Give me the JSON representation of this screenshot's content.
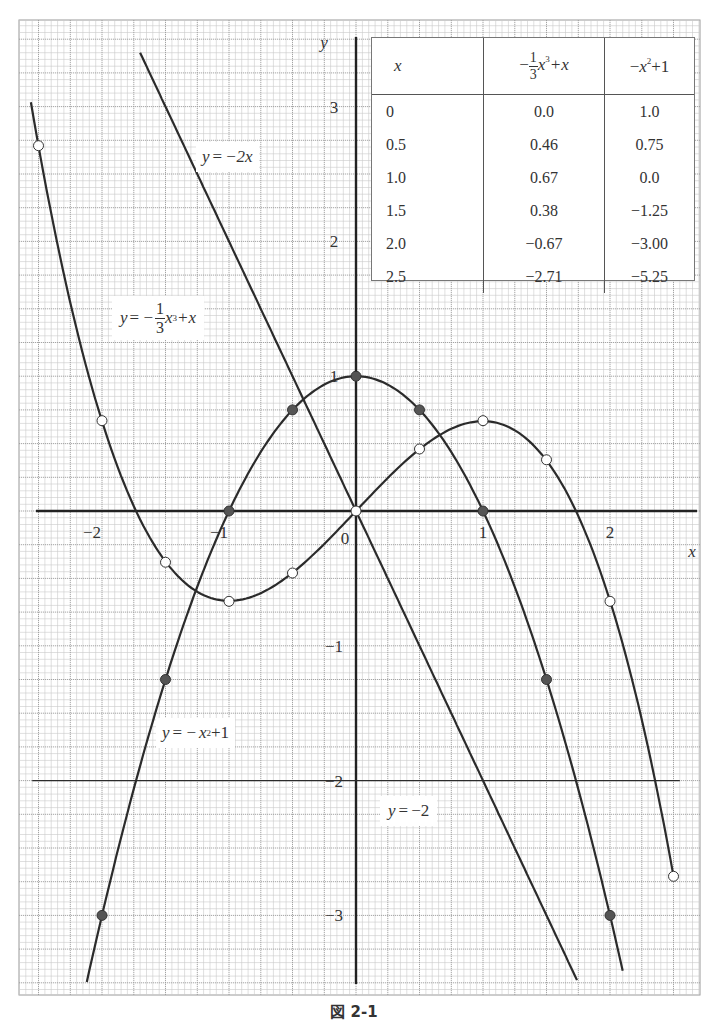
{
  "caption": "図 2-1",
  "chart_data": {
    "type": "line",
    "title": "図 2-1",
    "xlabel": "x",
    "ylabel": "y",
    "xlim": [
      -2.55,
      2.55
    ],
    "ylim": [
      -3.55,
      3.55
    ],
    "grid": true,
    "x_ticks": [
      -2,
      -1,
      0,
      1,
      2
    ],
    "x_tick_labels": [
      "−2",
      "−1",
      "0",
      "1",
      "2"
    ],
    "y_ticks": [
      -3,
      -2,
      -1,
      1,
      2,
      3
    ],
    "y_tick_labels": [
      "−3",
      "−2",
      "−1",
      "1",
      "2",
      "3"
    ],
    "series": [
      {
        "name": "y=−1/3x³+x",
        "expr": "cubic",
        "x_range": [
          -2.56,
          2.5
        ],
        "marker": "open-circle",
        "points": [
          {
            "x": -2.5,
            "y": 2.71
          },
          {
            "x": -2.0,
            "y": 0.67
          },
          {
            "x": -1.5,
            "y": -0.38
          },
          {
            "x": -1.0,
            "y": -0.67
          },
          {
            "x": -0.5,
            "y": -0.46
          },
          {
            "x": 0.0,
            "y": 0.0
          },
          {
            "x": 0.5,
            "y": 0.46
          },
          {
            "x": 1.0,
            "y": 0.67
          },
          {
            "x": 1.5,
            "y": 0.38
          },
          {
            "x": 2.0,
            "y": -0.67
          },
          {
            "x": 2.5,
            "y": -2.71
          }
        ]
      },
      {
        "name": "y=−x²+1",
        "expr": "parabola",
        "x_range": [
          -2.12,
          2.1
        ],
        "marker": "filled-circle",
        "points": [
          {
            "x": -2.0,
            "y": -3.0
          },
          {
            "x": -1.5,
            "y": -1.25
          },
          {
            "x": -1.0,
            "y": 0.0
          },
          {
            "x": -0.5,
            "y": 0.75
          },
          {
            "x": 0.0,
            "y": 1.0
          },
          {
            "x": 0.5,
            "y": 0.75
          },
          {
            "x": 1.0,
            "y": 0.0
          },
          {
            "x": 1.5,
            "y": -1.25
          },
          {
            "x": 2.0,
            "y": -3.0
          }
        ]
      },
      {
        "name": "y=−2x",
        "expr": "linear",
        "x_range": [
          -1.7,
          1.74
        ],
        "marker": "none",
        "points": [
          {
            "x": -1.7,
            "y": 3.4
          },
          {
            "x": 1.74,
            "y": -3.48
          }
        ]
      },
      {
        "name": "y=−2",
        "expr": "constant",
        "x_range": [
          -2.55,
          2.55
        ],
        "marker": "none",
        "points": [
          {
            "x": -2.55,
            "y": -2
          },
          {
            "x": 2.55,
            "y": -2
          }
        ]
      }
    ],
    "annotations": [
      {
        "text": "y=−2x",
        "x": -1.0,
        "y": 2.8
      },
      {
        "text": "y=−1/3x³+x",
        "x": -1.85,
        "y": 1.45
      },
      {
        "text": "y=−x²+1",
        "x": -1.4,
        "y": -1.6
      },
      {
        "text": "y=−2",
        "x": 0.45,
        "y": -2.3
      }
    ],
    "value_table": {
      "headers": [
        "x",
        "−1/3x³+x",
        "−x²+1"
      ],
      "rows": [
        [
          "0",
          "0.0",
          "1.0"
        ],
        [
          "0.5",
          "0.46",
          "0.75"
        ],
        [
          "1.0",
          "0.67",
          "0.0"
        ],
        [
          "1.5",
          "0.38",
          "−1.25"
        ],
        [
          "2.0",
          "−0.67",
          "−3.00"
        ],
        [
          "2.5",
          "−2.71",
          "−5.25"
        ]
      ]
    }
  },
  "table": {
    "header_x": "x",
    "header_cubic": {
      "prefix": "−",
      "num": "1",
      "den": "3",
      "var": "x",
      "exp": "3",
      "suffix": "+x"
    },
    "header_parab": {
      "prefix": "−",
      "var": "x",
      "exp": "2",
      "suffix": "+1"
    },
    "rows": [
      [
        "0",
        "0.0",
        "1.0"
      ],
      [
        "0.5",
        "0.46",
        "0.75"
      ],
      [
        "1.0",
        "0.67",
        "0.0"
      ],
      [
        "1.5",
        "0.38",
        "−1.25"
      ],
      [
        "2.0",
        "−0.67",
        "−3.00"
      ],
      [
        "2.5",
        "−2.71",
        "−5.25"
      ]
    ]
  },
  "labels": {
    "line": {
      "lhs": "y",
      "eq": "= ",
      "rhs": "−2x"
    },
    "cubic": {
      "lhs": "y",
      "eq": "= −",
      "num": "1",
      "den": "3",
      "var": "x",
      "exp": "3",
      "suffix": "+x"
    },
    "parab": {
      "lhs": "y",
      "eq": "= −",
      "var": "x",
      "exp": "2",
      "suffix": "+1"
    },
    "hline": {
      "lhs": "y",
      "eq": "= ",
      "rhs": "−2"
    }
  },
  "axes": {
    "x_name": "x",
    "y_name": "y",
    "origin": "0"
  },
  "style": {
    "curve_color": "#2b2b2b",
    "grid_minor": "#c9c9c9",
    "grid_major": "#9a9a9a",
    "filled_marker": "#555555"
  }
}
